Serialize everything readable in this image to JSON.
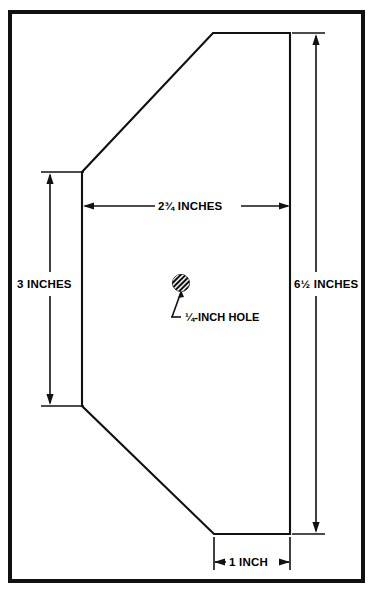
{
  "drawing": {
    "title": "Cutting template pattern with dimensions",
    "units": "inches",
    "line_color": "#111111",
    "background_color": "#ffffff"
  },
  "dimensions": {
    "width_top_label": "2¾ INCHES",
    "left_height_label": "3 INCHES",
    "right_height_label": "6½ INCHES",
    "bottom_width_label": "1 INCH",
    "hole_label": "¼-INCH HOLE"
  },
  "shape": {
    "name": "octagonal-template",
    "vertices": [
      [
        213,
        33
      ],
      [
        290,
        33
      ],
      [
        290,
        534
      ],
      [
        214,
        534
      ],
      [
        82,
        406
      ],
      [
        82,
        172
      ]
    ]
  },
  "hole": {
    "name": "quarter-inch-hole",
    "center_x": 181,
    "center_y": 283,
    "radius": 8.5,
    "fill": "#111111",
    "hatch_color": "#ffffff"
  },
  "frame": {
    "x": 8,
    "y": 10,
    "width": 357,
    "height": 573,
    "stroke": "#111111"
  }
}
